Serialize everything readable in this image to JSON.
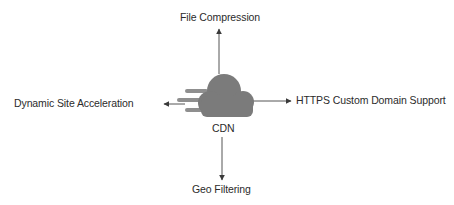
{
  "diagram": {
    "center": {
      "label": "CDN",
      "icon": "cloud-icon"
    },
    "branches": [
      {
        "direction": "up",
        "label": "File Compression"
      },
      {
        "direction": "left",
        "label": "Dynamic Site Acceleration"
      },
      {
        "direction": "right",
        "label": "HTTPS Custom Domain Support"
      },
      {
        "direction": "down",
        "label": "Geo Filtering"
      }
    ],
    "colors": {
      "cloud": "#7a7a7a",
      "lines": "#4a4a4a",
      "text": "#2b2b2b",
      "speed_lines": "#8a8a8a"
    }
  }
}
